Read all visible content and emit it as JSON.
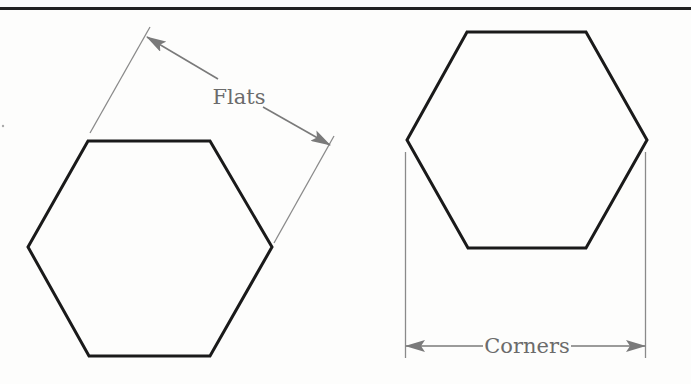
{
  "diagram": {
    "colors": {
      "background": "#fdfdfc",
      "outline": "#1a1a1a",
      "dimension": "#7a7a7a",
      "label": "#6b6b6b"
    },
    "labels": {
      "flats": "Flats",
      "corners": "Corners"
    },
    "shapes": [
      {
        "name": "left-hexagon",
        "orientation": "flat-top",
        "dimension": "Flats"
      },
      {
        "name": "right-hexagon",
        "orientation": "flat-top",
        "dimension": "Corners"
      }
    ]
  }
}
